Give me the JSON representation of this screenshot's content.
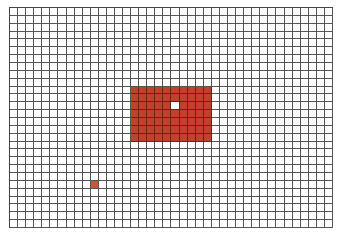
{
  "grid": {
    "columns": 40,
    "rows": 28,
    "line_color": "#555555",
    "background_color": "#ffffff"
  },
  "colors": {
    "filled": "#c0412c",
    "filled_grid_line": "#6e2015",
    "single_marker": "#c9543d",
    "highlight": "#ffffff"
  },
  "regions": [
    {
      "name": "main-block",
      "type": "filled",
      "col_start": 15,
      "col_end": 24,
      "row_start": 10,
      "row_end": 16
    },
    {
      "name": "single-cell",
      "type": "single",
      "col_start": 10,
      "col_end": 10,
      "row_start": 22,
      "row_end": 22
    }
  ],
  "highlight_cells": [
    {
      "col": 20,
      "row": 12
    }
  ]
}
